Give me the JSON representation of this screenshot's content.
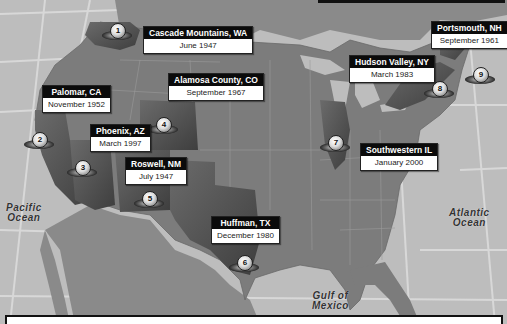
{
  "map": {
    "title": "UFO sighting locations across the United States",
    "oceans": [
      {
        "id": "pacific",
        "line1": "Pacific",
        "line2": "Ocean"
      },
      {
        "id": "atlantic",
        "line1": "Atlantic",
        "line2": "Ocean"
      },
      {
        "id": "gulf",
        "line1": "Gulf of",
        "line2": "Mexico"
      }
    ],
    "sightings": [
      {
        "number": "1",
        "location": "Cascade Mountains, WA",
        "date": "June 1947"
      },
      {
        "number": "2",
        "location": "Palomar, CA",
        "date": "November 1952"
      },
      {
        "number": "3",
        "location": "Phoenix, AZ",
        "date": "March 1997"
      },
      {
        "number": "4",
        "location": "Alamosa County, CO",
        "date": "September 1967"
      },
      {
        "number": "5",
        "location": "Roswell, NM",
        "date": "July 1947"
      },
      {
        "number": "6",
        "location": "Huffman, TX",
        "date": "December 1980"
      },
      {
        "number": "7",
        "location": "Southwestern IL",
        "date": "January 2000"
      },
      {
        "number": "8",
        "location": "Hudson Valley, NY",
        "date": "March 1983"
      },
      {
        "number": "9",
        "location": "Portsmouth, NH",
        "date": "September 1961"
      }
    ],
    "colors": {
      "ocean": "#bdbdbd",
      "land": "#7c7c7c",
      "highlight_state": "#5f5f5f",
      "callout_header": "#0b0b0b",
      "callout_body": "#ffffff"
    }
  }
}
